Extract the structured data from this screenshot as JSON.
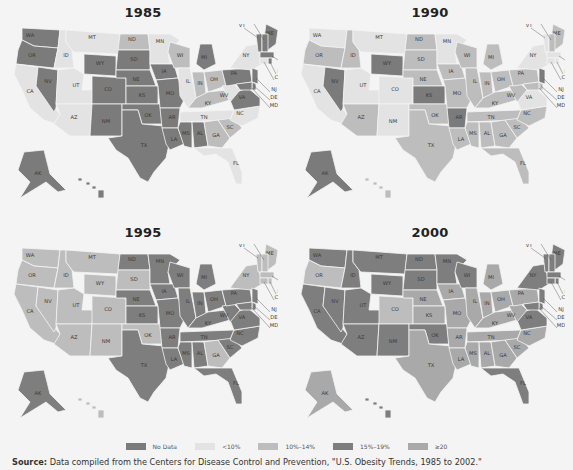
{
  "legend": {
    "items": [
      {
        "key": "nodata",
        "label": "No Data",
        "color": "#7b7b7b"
      },
      {
        "key": "lt10",
        "label": "<10%",
        "color": "#e3e3e3"
      },
      {
        "key": "10to14",
        "label": "10%–14%",
        "color": "#bdbdbd"
      },
      {
        "key": "15to19",
        "label": "15%–19%",
        "color": "#7e7e7e"
      },
      {
        "key": "gte20",
        "label": "≥20",
        "color": "#a9a9a9"
      }
    ]
  },
  "source": {
    "prefix": "Source:",
    "text": " Data compiled from the Centers for Disease Control and Prevention, \"U.S. Obesity Trends, 1985 to 2002.\""
  },
  "chart_data": {
    "type": "choropleth",
    "title": "U.S. Obesity Trends",
    "legend_position": "bottom",
    "categories": [
      "No Data",
      "<10%",
      "10%–14%",
      "15%–19%",
      "≥20"
    ],
    "maps": [
      {
        "year": "1985",
        "states": {
          "WA": "nodata",
          "OR": "nodata",
          "CA": "lt10",
          "NV": "nodata",
          "ID": "lt10",
          "MT": "lt10",
          "WY": "nodata",
          "UT": "lt10",
          "AZ": "lt10",
          "CO": "nodata",
          "NM": "nodata",
          "ND": "10to14",
          "SD": "nodata",
          "NE": "nodata",
          "KS": "nodata",
          "OK": "nodata",
          "TX": "nodata",
          "MN": "lt10",
          "IA": "nodata",
          "MO": "nodata",
          "AR": "nodata",
          "LA": "nodata",
          "WI": "10to14",
          "IL": "lt10",
          "MI": "nodata",
          "IN": "10to14",
          "OH": "10to14",
          "KY": "10to14",
          "TN": "lt10",
          "MS": "nodata",
          "AL": "nodata",
          "GA": "10to14",
          "FL": "lt10",
          "SC": "10to14",
          "NC": "lt10",
          "VA": "nodata",
          "WV": "lt10",
          "PA": "nodata",
          "NY": "lt10",
          "ME": "nodata",
          "VT": "nodata",
          "NH": "nodata",
          "MA": "nodata",
          "RI": "nodata",
          "CT": "lt10",
          "NJ": "nodata",
          "DE": "nodata",
          "MD": "nodata",
          "AK": "nodata",
          "HI": "nodata"
        }
      },
      {
        "year": "1990",
        "states": {
          "WA": "lt10",
          "OR": "10to14",
          "CA": "lt10",
          "NV": "nodata",
          "ID": "10to14",
          "MT": "lt10",
          "WY": "nodata",
          "UT": "lt10",
          "AZ": "10to14",
          "CO": "lt10",
          "NM": "lt10",
          "ND": "10to14",
          "SD": "10to14",
          "NE": "10to14",
          "KS": "nodata",
          "OK": "10to14",
          "TX": "10to14",
          "MN": "lt10",
          "IA": "10to14",
          "MO": "10to14",
          "AR": "nodata",
          "LA": "10to14",
          "WI": "10to14",
          "IL": "10to14",
          "MI": "10to14",
          "IN": "10to14",
          "OH": "10to14",
          "KY": "10to14",
          "TN": "10to14",
          "MS": "10to14",
          "AL": "10to14",
          "GA": "10to14",
          "FL": "10to14",
          "SC": "10to14",
          "NC": "10to14",
          "VA": "lt10",
          "WV": "10to14",
          "PA": "10to14",
          "NY": "lt10",
          "ME": "10to14",
          "VT": "lt10",
          "NH": "10to14",
          "MA": "lt10",
          "RI": "lt10",
          "CT": "lt10",
          "NJ": "nodata",
          "DE": "10to14",
          "MD": "10to14",
          "AK": "nodata",
          "HI": "10to14"
        }
      },
      {
        "year": "1995",
        "states": {
          "WA": "10to14",
          "OR": "10to14",
          "CA": "10to14",
          "NV": "10to14",
          "ID": "10to14",
          "MT": "10to14",
          "WY": "10to14",
          "UT": "10to14",
          "AZ": "10to14",
          "CO": "10to14",
          "NM": "10to14",
          "ND": "15to19",
          "SD": "10to14",
          "NE": "15to19",
          "KS": "15to19",
          "OK": "10to14",
          "TX": "15to19",
          "MN": "15to19",
          "IA": "15to19",
          "MO": "15to19",
          "AR": "15to19",
          "LA": "15to19",
          "WI": "15to19",
          "IL": "15to19",
          "MI": "15to19",
          "IN": "15to19",
          "OH": "15to19",
          "KY": "15to19",
          "TN": "15to19",
          "MS": "15to19",
          "AL": "15to19",
          "GA": "10to14",
          "FL": "15to19",
          "SC": "15to19",
          "NC": "15to19",
          "VA": "15to19",
          "WV": "15to19",
          "PA": "15to19",
          "NY": "10to14",
          "ME": "10to14",
          "VT": "10to14",
          "NH": "10to14",
          "MA": "10to14",
          "RI": "10to14",
          "CT": "10to14",
          "NJ": "15to19",
          "DE": "15to19",
          "MD": "15to19",
          "AK": "15to19",
          "HI": "10to14"
        }
      },
      {
        "year": "2000",
        "states": {
          "WA": "15to19",
          "OR": "10to14",
          "CA": "15to19",
          "NV": "15to19",
          "ID": "15to19",
          "MT": "15to19",
          "WY": "15to19",
          "UT": "15to19",
          "AZ": "15to19",
          "CO": "10to14",
          "NM": "15to19",
          "ND": "15to19",
          "SD": "15to19",
          "NE": "gte20",
          "KS": "gte20",
          "OK": "15to19",
          "TX": "gte20",
          "MN": "15to19",
          "IA": "gte20",
          "MO": "gte20",
          "AR": "gte20",
          "LA": "gte20",
          "WI": "15to19",
          "IL": "gte20",
          "MI": "gte20",
          "IN": "gte20",
          "OH": "gte20",
          "KY": "gte20",
          "TN": "gte20",
          "MS": "gte20",
          "AL": "gte20",
          "GA": "gte20",
          "FL": "15to19",
          "SC": "gte20",
          "NC": "gte20",
          "VA": "15to19",
          "WV": "gte20",
          "PA": "gte20",
          "NY": "15to19",
          "ME": "15to19",
          "VT": "15to19",
          "NH": "15to19",
          "MA": "15to19",
          "RI": "15to19",
          "CT": "15to19",
          "NJ": "15to19",
          "DE": "15to19",
          "MD": "15to19",
          "AK": "gte20",
          "HI": "15to19"
        }
      }
    ]
  },
  "panels": [
    {
      "title": "1985"
    },
    {
      "title": "1990"
    },
    {
      "title": "1995"
    },
    {
      "title": "2000"
    }
  ]
}
